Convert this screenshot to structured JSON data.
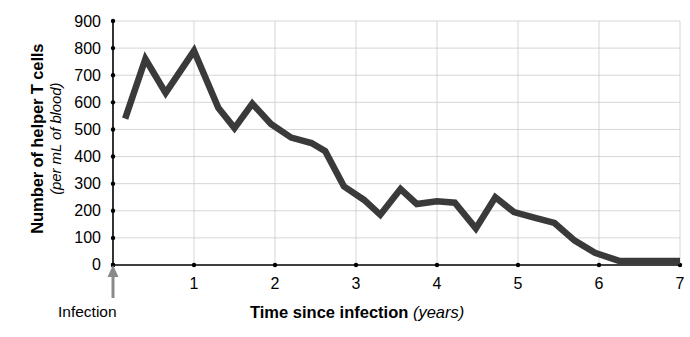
{
  "chart_data": {
    "type": "line",
    "title": "",
    "xlabel": "Time since infection",
    "xlabel_unit": "(years)",
    "ylabel": "Number of helper T cells",
    "ylabel_unit": "(per mL of blood)",
    "xlim": [
      0,
      7
    ],
    "ylim": [
      0,
      900
    ],
    "grid": true,
    "legend": "none",
    "line_color": "#3a3a3a",
    "x_ticks": [
      "0",
      "1",
      "2",
      "3",
      "4",
      "5",
      "6",
      "7"
    ],
    "y_ticks": [
      "0",
      "100",
      "200",
      "300",
      "400",
      "500",
      "600",
      "700",
      "800",
      "900"
    ],
    "annotations": [
      {
        "name": "infection-arrow",
        "label": "Infection",
        "x": 0,
        "y": 0
      }
    ],
    "series": [
      {
        "name": "Helper T cells",
        "x": [
          0.15,
          0.4,
          0.65,
          1.0,
          1.3,
          1.5,
          1.72,
          1.95,
          2.2,
          2.45,
          2.62,
          2.85,
          3.1,
          3.3,
          3.55,
          3.75,
          4.0,
          4.22,
          4.48,
          4.72,
          4.95,
          5.2,
          5.45,
          5.7,
          5.95,
          6.25,
          7.0
        ],
        "y": [
          540,
          760,
          635,
          790,
          580,
          505,
          595,
          520,
          470,
          450,
          420,
          290,
          240,
          185,
          280,
          225,
          235,
          230,
          135,
          250,
          195,
          175,
          155,
          90,
          45,
          15,
          15
        ]
      }
    ]
  }
}
